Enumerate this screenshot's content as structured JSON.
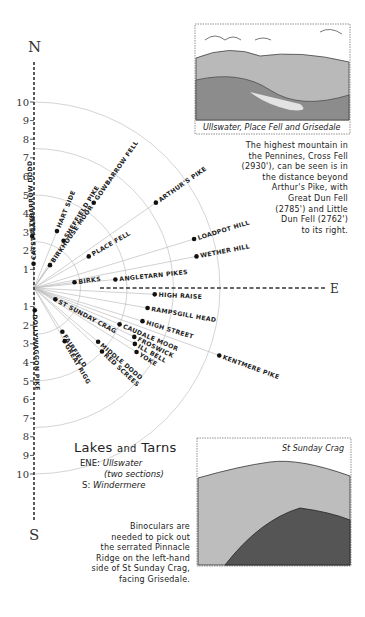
{
  "compass": {
    "north": "N",
    "south": "S",
    "east": "E"
  },
  "scale_ticks": [
    "1",
    "2",
    "3",
    "4",
    "5",
    "6",
    "7",
    "8",
    "9",
    "10"
  ],
  "rings_miles": [
    2.5,
    5,
    7.5,
    10
  ],
  "peaks_north": [
    {
      "name": "STYBARROW DODD",
      "bearing": 358,
      "distance": 2.8
    },
    {
      "name": "CATSTYCAM",
      "bearing": 359,
      "distance": 1.3
    },
    {
      "name": "HART SIDE",
      "bearing": 22,
      "distance": 3.3
    },
    {
      "name": "SHEFFIELD PIKE",
      "bearing": 32,
      "distance": 3.0
    },
    {
      "name": "BIRKHOUSE MOOR",
      "bearing": 35,
      "distance": 1.5
    },
    {
      "name": "GOWBARROW FELL",
      "bearing": 35,
      "distance": 5.6
    },
    {
      "name": "ARTHUR'S PIKE",
      "bearing": 55,
      "distance": 8.0
    },
    {
      "name": "PLACE FELL",
      "bearing": 60,
      "distance": 3.4
    },
    {
      "name": "LOADPOT HILL",
      "bearing": 73,
      "distance": 9.0
    },
    {
      "name": "WETHER HILL",
      "bearing": 79,
      "distance": 8.9
    },
    {
      "name": "BIRKS",
      "bearing": 82,
      "distance": 2.2
    },
    {
      "name": "ANGLETARN PIKES",
      "bearing": 84,
      "distance": 4.4
    }
  ],
  "peaks_south": [
    {
      "name": "HIGH RAISE",
      "bearing": 93,
      "distance": 6.5
    },
    {
      "name": "ST SUNDAY CRAG",
      "bearing": 118,
      "distance": 1.3
    },
    {
      "name": "RAMPSGILL HEAD",
      "bearing": 100,
      "distance": 6.2
    },
    {
      "name": "HIGH STREET",
      "bearing": 107,
      "distance": 6.1
    },
    {
      "name": "CAUDALE MOOR",
      "bearing": 113,
      "distance": 5.0
    },
    {
      "name": "FROSWICK",
      "bearing": 116,
      "distance": 6.0
    },
    {
      "name": "ILL BELL",
      "bearing": 119,
      "distance": 6.2
    },
    {
      "name": "YOKE",
      "bearing": 122,
      "distance": 6.5
    },
    {
      "name": "KENTMERE PIKE",
      "bearing": 110,
      "distance": 10.6
    },
    {
      "name": "MIDDLE DODD",
      "bearing": 130,
      "distance": 4.5
    },
    {
      "name": "RED SCREES",
      "bearing": 133,
      "distance": 5.0
    },
    {
      "name": "FAIRFIELD",
      "bearing": 147,
      "distance": 2.8
    },
    {
      "name": "GREAT RIGG",
      "bearing": 150,
      "distance": 3.3
    },
    {
      "name": "DOLLYWAGGON PIKE",
      "bearing": 178,
      "distance": 1.2
    }
  ],
  "sketches": {
    "top": {
      "caption": "Ullswater, Place Fell and Grisedale"
    },
    "bottom": {
      "caption": "St Sunday Crag"
    }
  },
  "notes": {
    "cross_fell": [
      "The highest mountain in",
      "the Pennines, Cross Fell",
      "(2930'), can be seen is in",
      "the distance beyond",
      "Arthur's Pike, with",
      "Great Dun Fell",
      "(2785') and Little",
      "Dun Fell (2762')",
      "to its right."
    ],
    "binoculars": [
      "Binoculars are",
      "needed to pick out",
      "the serrated Pinnacle",
      "Ridge on the left-hand",
      "side of St Sunday Crag,",
      "facing Grisedale."
    ]
  },
  "lakes": {
    "title_a": "Lakes",
    "title_and": "and",
    "title_b": "Tarns",
    "entries": [
      {
        "dir": "ENE:",
        "name": "Ullswater",
        "sub": "(two sections)"
      },
      {
        "dir": "S:",
        "name": "Windermere",
        "sub": ""
      }
    ]
  }
}
